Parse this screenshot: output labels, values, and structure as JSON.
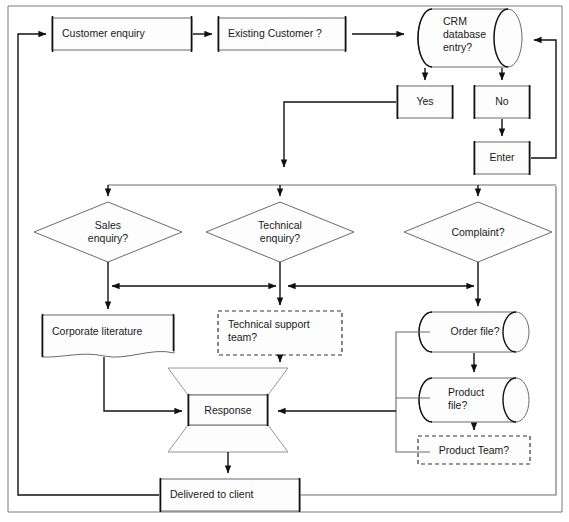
{
  "diagram": {
    "colors": {
      "stroke": "#4d4d4d",
      "stroke_dark": "#111111",
      "text": "#1a1a1a",
      "background": "#ffffff"
    },
    "nodes": [
      {
        "id": "customer_enquiry",
        "label": "Customer enquiry",
        "shape": "process",
        "x": 52,
        "y": 18,
        "w": 140,
        "h": 32
      },
      {
        "id": "existing_customer",
        "label": "Existing Customer ?",
        "shape": "process",
        "x": 218,
        "y": 18,
        "w": 128,
        "h": 32
      },
      {
        "id": "crm_database",
        "label": "CRM\ndatabase\nentry?",
        "shape": "database",
        "x": 412,
        "y": 9,
        "w": 116,
        "h": 58
      },
      {
        "id": "yes",
        "label": "Yes",
        "shape": "process",
        "x": 397,
        "y": 86,
        "w": 56,
        "h": 32
      },
      {
        "id": "no",
        "label": "No",
        "shape": "process",
        "x": 474,
        "y": 86,
        "w": 56,
        "h": 32
      },
      {
        "id": "enter",
        "label": "Enter",
        "shape": "process",
        "x": 474,
        "y": 142,
        "w": 56,
        "h": 32
      },
      {
        "id": "sales_enquiry",
        "label": "Sales\nenquiry?",
        "shape": "decision",
        "x": 34,
        "y": 202,
        "w": 148,
        "h": 60
      },
      {
        "id": "technical_enquiry",
        "label": "Technical\nenquiry?",
        "shape": "decision",
        "x": 206,
        "y": 202,
        "w": 148,
        "h": 60
      },
      {
        "id": "complaint",
        "label": "Complaint?",
        "shape": "decision",
        "x": 404,
        "y": 202,
        "w": 148,
        "h": 60
      },
      {
        "id": "corporate_literature",
        "label": "Corporate literature",
        "shape": "document",
        "x": 42,
        "y": 315,
        "w": 132,
        "h": 42
      },
      {
        "id": "technical_support_team",
        "label": "Technical support\nteam?",
        "shape": "dashed",
        "x": 218,
        "y": 311,
        "w": 124,
        "h": 44
      },
      {
        "id": "order_file",
        "label": "Order file?",
        "shape": "database",
        "x": 418,
        "y": 312,
        "w": 112,
        "h": 40
      },
      {
        "id": "product_file",
        "label": "Product\nfile?",
        "shape": "database",
        "x": 418,
        "y": 378,
        "w": 112,
        "h": 44
      },
      {
        "id": "product_team",
        "label": "Product Team?",
        "shape": "dashed",
        "x": 418,
        "y": 436,
        "w": 112,
        "h": 28
      },
      {
        "id": "response",
        "label": "Response",
        "shape": "process_bowtie",
        "x": 188,
        "y": 395,
        "w": 80,
        "h": 30
      },
      {
        "id": "delivered_to_client",
        "label": "Delivered to client",
        "shape": "process",
        "x": 160,
        "y": 479,
        "w": 140,
        "h": 32
      }
    ],
    "edges": [
      {
        "id": "e-enquiry-to-existing",
        "from": "customer_enquiry",
        "to": "existing_customer",
        "arrow": "single"
      },
      {
        "id": "e-existing-to-crm",
        "from": "existing_customer",
        "to": "crm_database",
        "arrow": "single"
      },
      {
        "id": "e-crm-to-yes",
        "from": "crm_database",
        "to": "yes",
        "arrow": "single"
      },
      {
        "id": "e-crm-to-no",
        "from": "crm_database",
        "to": "no",
        "arrow": "single"
      },
      {
        "id": "e-no-to-enter",
        "from": "no",
        "to": "enter",
        "arrow": "single"
      },
      {
        "id": "e-enter-to-crm",
        "from": "enter",
        "to": "crm_database",
        "arrow": "single"
      },
      {
        "id": "e-yes-to-bus",
        "from": "yes",
        "to": "distribution_bus",
        "arrow": "single"
      },
      {
        "id": "e-bus-to-sales",
        "from": "distribution_bus",
        "to": "sales_enquiry",
        "arrow": "single"
      },
      {
        "id": "e-bus-to-technical",
        "from": "distribution_bus",
        "to": "technical_enquiry",
        "arrow": "single"
      },
      {
        "id": "e-bus-to-complaint",
        "from": "distribution_bus",
        "to": "complaint",
        "arrow": "single"
      },
      {
        "id": "e-sales-technical-link",
        "from": "sales_enquiry",
        "to": "technical_enquiry",
        "arrow": "double"
      },
      {
        "id": "e-technical-complaint-link",
        "from": "technical_enquiry",
        "to": "complaint",
        "arrow": "double"
      },
      {
        "id": "e-sales-to-literature",
        "from": "sales_enquiry",
        "to": "corporate_literature",
        "arrow": "single"
      },
      {
        "id": "e-technical-to-support",
        "from": "technical_enquiry",
        "to": "technical_support_team",
        "arrow": "single"
      },
      {
        "id": "e-complaint-to-order",
        "from": "complaint",
        "to": "order_file",
        "arrow": "single"
      },
      {
        "id": "e-order-to-product",
        "from": "order_file",
        "to": "product_file",
        "arrow": "single"
      },
      {
        "id": "e-product-to-team",
        "from": "product_file",
        "to": "product_team",
        "arrow": "single"
      },
      {
        "id": "e-literature-to-response",
        "from": "corporate_literature",
        "to": "response",
        "arrow": "single"
      },
      {
        "id": "e-support-to-response",
        "from": "technical_support_team",
        "to": "response",
        "arrow": "single"
      },
      {
        "id": "e-files-to-response",
        "from": "order_file",
        "to": "response",
        "arrow": "single"
      },
      {
        "id": "e-response-to-delivered",
        "from": "response",
        "to": "delivered_to_client",
        "arrow": "single"
      },
      {
        "id": "e-delivered-feedback",
        "from": "delivered_to_client",
        "to": "customer_enquiry",
        "arrow": "single"
      }
    ]
  }
}
